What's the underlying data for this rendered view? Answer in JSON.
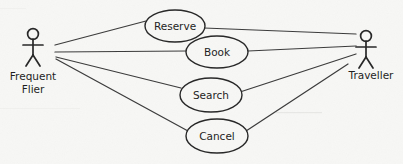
{
  "diagram": {
    "type": "uml-use-case-diagram",
    "width": 403,
    "height": 164,
    "background_color": "#f7f7f5",
    "stroke_color": "#262626",
    "line_color": "#3a3a3a",
    "text_color": "#1c1c1c"
  },
  "actors": [
    {
      "id": "frequent-flier",
      "label_line1": "Frequent",
      "label_line2": "Flier",
      "side": "left",
      "head_cx": 33,
      "head_cy": 34,
      "head_r": 5.4,
      "body_top": 39,
      "body_bottom": 55,
      "arm_y": 45,
      "arm_half_width": 9.5,
      "leg_spread": 7,
      "leg_bottom": 66,
      "label_x": 33,
      "label_y1": 79,
      "label_y2": 92
    },
    {
      "id": "traveller",
      "label_line1": "Traveller",
      "label_line2": "",
      "side": "right",
      "head_cx": 366,
      "head_cy": 36,
      "head_r": 5.4,
      "body_top": 41,
      "body_bottom": 57,
      "arm_y": 47,
      "arm_half_width": 9.5,
      "leg_spread": 7,
      "leg_bottom": 68,
      "label_x": 371,
      "label_y1": 78,
      "label_y2": 0
    }
  ],
  "use_cases": [
    {
      "id": "reserve",
      "label": "Reserve",
      "cx": 175,
      "cy": 26,
      "rx": 30,
      "ry": 16
    },
    {
      "id": "book",
      "label": "Book",
      "cx": 217,
      "cy": 52,
      "rx": 31,
      "ry": 16
    },
    {
      "id": "search",
      "label": "Search",
      "cx": 211,
      "cy": 95,
      "rx": 31,
      "ry": 17
    },
    {
      "id": "cancel",
      "label": "Cancel",
      "cx": 217,
      "cy": 136,
      "rx": 31,
      "ry": 17
    }
  ],
  "associations": [
    {
      "id": "flier-reserve",
      "from": "frequent-flier",
      "to": "reserve",
      "x1": 55,
      "y1": 45,
      "x2": 146,
      "y2": 21
    },
    {
      "id": "flier-book",
      "from": "frequent-flier",
      "to": "book",
      "x1": 55,
      "y1": 52,
      "x2": 187,
      "y2": 51
    },
    {
      "id": "flier-search",
      "from": "frequent-flier",
      "to": "search",
      "x1": 56,
      "y1": 57,
      "x2": 181,
      "y2": 88
    },
    {
      "id": "flier-cancel",
      "from": "frequent-flier",
      "to": "cancel",
      "x1": 56,
      "y1": 59,
      "x2": 188,
      "y2": 131
    },
    {
      "id": "reserve-traveller",
      "from": "reserve",
      "to": "traveller",
      "x1": 204,
      "y1": 28,
      "x2": 356,
      "y2": 34
    },
    {
      "id": "book-traveller",
      "from": "book",
      "to": "traveller",
      "x1": 248,
      "y1": 51,
      "x2": 356,
      "y2": 46
    },
    {
      "id": "search-traveller",
      "from": "search",
      "to": "traveller",
      "x1": 240,
      "y1": 92,
      "x2": 356,
      "y2": 54
    },
    {
      "id": "cancel-traveller",
      "from": "cancel",
      "to": "traveller",
      "x1": 243,
      "y1": 133,
      "x2": 348,
      "y2": 64
    }
  ]
}
